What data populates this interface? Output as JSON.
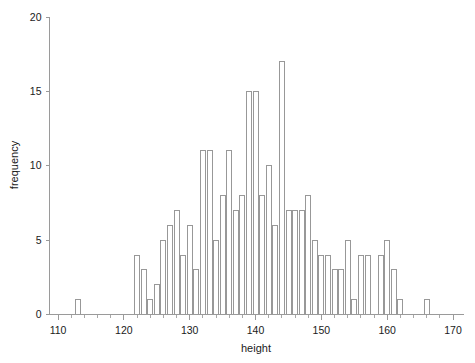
{
  "chart_data": {
    "type": "bar",
    "title": "",
    "subtitle": "",
    "xlabel": "height",
    "ylabel": "frequency",
    "xlim": [
      108,
      172
    ],
    "ylim": [
      0,
      20
    ],
    "xticks": [
      110,
      120,
      130,
      140,
      150,
      160,
      170
    ],
    "yticks": [
      0,
      5,
      10,
      15,
      20
    ],
    "xtick_labels": [
      "110",
      "120",
      "130",
      "140",
      "150",
      "160",
      "170"
    ],
    "ytick_labels": [
      "0",
      "5",
      "10",
      "15",
      "20"
    ],
    "x_minor_tick_step": 2,
    "grid": false,
    "legend": null,
    "bin_width": 1,
    "bar_fill": "#ffffff",
    "bar_stroke": "#8d8d8d",
    "axis_color": "#9a9a9a",
    "text_color": "#1a1a1a",
    "background": "#ffffff",
    "bins": [
      {
        "x": 113,
        "value": 1
      },
      {
        "x": 121,
        "value": 0
      },
      {
        "x": 122,
        "value": 4
      },
      {
        "x": 123,
        "value": 3
      },
      {
        "x": 124,
        "value": 1
      },
      {
        "x": 125,
        "value": 2
      },
      {
        "x": 126,
        "value": 5
      },
      {
        "x": 127,
        "value": 6
      },
      {
        "x": 128,
        "value": 7
      },
      {
        "x": 129,
        "value": 4
      },
      {
        "x": 130,
        "value": 6
      },
      {
        "x": 131,
        "value": 3
      },
      {
        "x": 132,
        "value": 11
      },
      {
        "x": 133,
        "value": 11
      },
      {
        "x": 134,
        "value": 5
      },
      {
        "x": 135,
        "value": 8
      },
      {
        "x": 136,
        "value": 11
      },
      {
        "x": 137,
        "value": 7
      },
      {
        "x": 138,
        "value": 8
      },
      {
        "x": 139,
        "value": 15
      },
      {
        "x": 140,
        "value": 15
      },
      {
        "x": 141,
        "value": 8
      },
      {
        "x": 142,
        "value": 10
      },
      {
        "x": 143,
        "value": 6
      },
      {
        "x": 144,
        "value": 17
      },
      {
        "x": 145,
        "value": 7
      },
      {
        "x": 146,
        "value": 7
      },
      {
        "x": 147,
        "value": 7
      },
      {
        "x": 148,
        "value": 8
      },
      {
        "x": 149,
        "value": 5
      },
      {
        "x": 150,
        "value": 4
      },
      {
        "x": 151,
        "value": 4
      },
      {
        "x": 152,
        "value": 3
      },
      {
        "x": 153,
        "value": 3
      },
      {
        "x": 154,
        "value": 5
      },
      {
        "x": 155,
        "value": 1
      },
      {
        "x": 156,
        "value": 4
      },
      {
        "x": 157,
        "value": 4
      },
      {
        "x": 159,
        "value": 4
      },
      {
        "x": 160,
        "value": 5
      },
      {
        "x": 161,
        "value": 3
      },
      {
        "x": 162,
        "value": 1
      },
      {
        "x": 166,
        "value": 1
      }
    ]
  }
}
